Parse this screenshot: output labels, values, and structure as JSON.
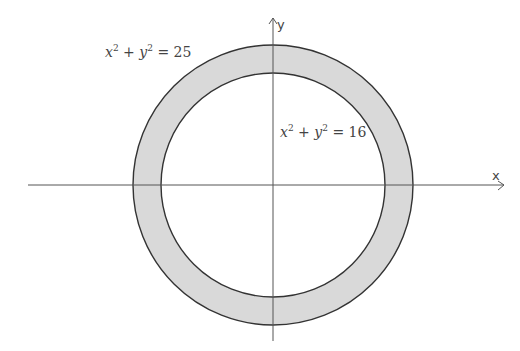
{
  "diagram": {
    "type": "annulus",
    "colors": {
      "ring_fill": "#d9d9d9",
      "stroke": "#333333",
      "axis": "#555555",
      "background": "#ffffff"
    },
    "axes": {
      "x_label": "x",
      "y_label": "y"
    },
    "circles": [
      {
        "name": "outer",
        "equation_lhs_x": "x",
        "equation_lhs_y": "y",
        "exponent": "2",
        "plus": "+",
        "equals": "=",
        "rhs": "25",
        "radius_units": 5
      },
      {
        "name": "inner",
        "equation_lhs_x": "x",
        "equation_lhs_y": "y",
        "exponent": "2",
        "plus": "+",
        "equals": "=",
        "rhs": "16",
        "radius_units": 4
      }
    ]
  }
}
